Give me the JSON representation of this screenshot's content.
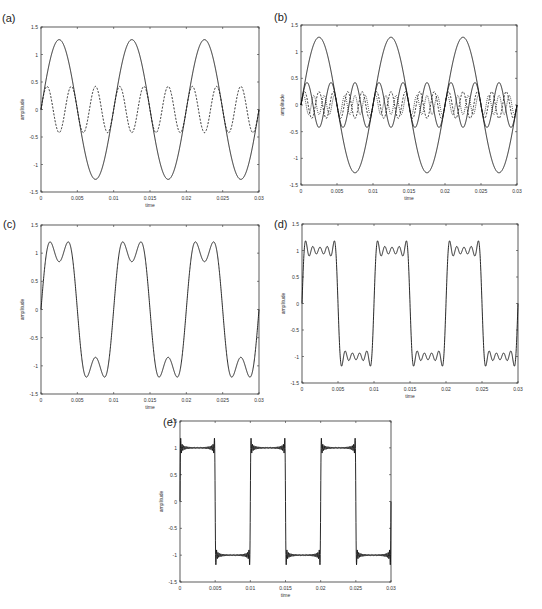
{
  "figure": {
    "panels": [
      {
        "id": "a",
        "label": "(a)",
        "xlabel": "time",
        "ylabel": "amplitude"
      },
      {
        "id": "b",
        "label": "(b)",
        "xlabel": "time",
        "ylabel": "amplitude"
      },
      {
        "id": "c",
        "label": "(c)",
        "xlabel": "time",
        "ylabel": "amplitude"
      },
      {
        "id": "d",
        "label": "(d)",
        "xlabel": "time",
        "ylabel": "amplitude"
      },
      {
        "id": "e",
        "label": "(e)",
        "xlabel": "time",
        "ylabel": "amplitude"
      }
    ],
    "xticks": [
      "0",
      "0.005",
      "0.01",
      "0.015",
      "0.02",
      "0.025",
      "0.03"
    ],
    "yticks": [
      "1.5",
      "1",
      "0.5",
      "0",
      "-0.5",
      "-1",
      "-1.5"
    ]
  },
  "chart_data": [
    {
      "type": "line",
      "title": "(a)",
      "xlabel": "time",
      "ylabel": "amplitude",
      "xlim": [
        0,
        0.03
      ],
      "ylim": [
        -1.5,
        1.5
      ],
      "grid": false,
      "series": [
        {
          "name": "fundamental (100 Hz)",
          "style": "solid",
          "amplitude": 1.27,
          "frequency_hz": 100
        },
        {
          "name": "3rd harmonic (300 Hz)",
          "style": "dashed",
          "amplitude": 0.42,
          "frequency_hz": 300
        }
      ]
    },
    {
      "type": "line",
      "title": "(b)",
      "xlabel": "time",
      "ylabel": "amplitude",
      "xlim": [
        0,
        0.03
      ],
      "ylim": [
        -1.5,
        1.5
      ],
      "grid": false,
      "series": [
        {
          "name": "fundamental (100 Hz)",
          "style": "solid",
          "amplitude": 1.27,
          "frequency_hz": 100
        },
        {
          "name": "3rd harmonic (300 Hz)",
          "style": "solid",
          "amplitude": 0.42,
          "frequency_hz": 300
        },
        {
          "name": "5th harmonic (500 Hz)",
          "style": "dashed",
          "amplitude": 0.25,
          "frequency_hz": 500
        },
        {
          "name": "7th harmonic (700 Hz)",
          "style": "dotted",
          "amplitude": 0.18,
          "frequency_hz": 700
        }
      ]
    },
    {
      "type": "line",
      "title": "(c)",
      "xlabel": "time",
      "ylabel": "amplitude",
      "xlim": [
        0,
        0.03
      ],
      "ylim": [
        -1.5,
        1.5
      ],
      "grid": false,
      "series": [
        {
          "name": "sum of 2 odd harmonics",
          "style": "solid",
          "harmonics": [
            1,
            3
          ],
          "peak": 1.2,
          "dip": 0.85
        }
      ]
    },
    {
      "type": "line",
      "title": "(d)",
      "xlabel": "time",
      "ylabel": "amplitude",
      "xlim": [
        0,
        0.03
      ],
      "ylim": [
        -1.5,
        1.5
      ],
      "grid": false,
      "series": [
        {
          "name": "sum of 5 odd harmonics",
          "style": "solid",
          "harmonics": [
            1,
            3,
            5,
            7,
            9
          ],
          "peak": 1.18
        }
      ]
    },
    {
      "type": "line",
      "title": "(e)",
      "xlabel": "time",
      "ylabel": "amplitude",
      "xlim": [
        0,
        0.03
      ],
      "ylim": [
        -1.5,
        1.5
      ],
      "grid": false,
      "series": [
        {
          "name": "sum of many odd harmonics (square wave approx.)",
          "style": "solid",
          "harmonics_count": 25,
          "peak": 1.13
        }
      ]
    }
  ]
}
